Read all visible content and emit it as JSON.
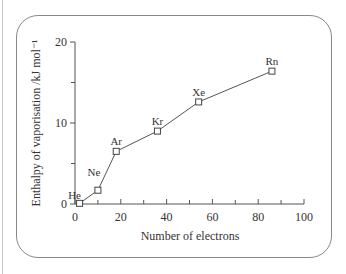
{
  "chart_data": {
    "type": "line",
    "title": "",
    "xlabel": "Number of electrons",
    "ylabel": "Enthalpy of vaporisation /kJ mol⁻¹",
    "xlim": [
      0,
      100
    ],
    "ylim": [
      0,
      20
    ],
    "x_ticks": [
      0,
      20,
      40,
      60,
      80,
      100
    ],
    "x_minor_ticks": [
      10,
      30,
      50,
      70,
      90
    ],
    "y_ticks": [
      0,
      10,
      20
    ],
    "y_minor_ticks": [
      5,
      15
    ],
    "grid": false,
    "marker": "open-square",
    "series": [
      {
        "name": "Noble gases",
        "points": [
          {
            "label": "He",
            "x": 2,
            "y": 0.08
          },
          {
            "label": "Ne",
            "x": 10,
            "y": 1.7
          },
          {
            "label": "Ar",
            "x": 18,
            "y": 6.5
          },
          {
            "label": "Kr",
            "x": 36,
            "y": 9.0
          },
          {
            "label": "Xe",
            "x": 54,
            "y": 12.6
          },
          {
            "label": "Rn",
            "x": 86,
            "y": 16.4
          }
        ]
      }
    ]
  },
  "labels": {
    "x_axis_title": "Number of electrons",
    "y_axis_title": "Enthalpy of vaporisation /kJ mol⁻¹"
  }
}
